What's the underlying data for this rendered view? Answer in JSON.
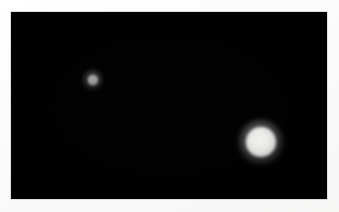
{
  "image": {
    "kind": "astronomical-photograph",
    "width": 339,
    "height": 212,
    "alt": "Dark astronomical field with two blurred glowing spherical objects",
    "background_color": "#000000",
    "mat_color": "#fdfdfd",
    "frame": {
      "left": 11,
      "top": 12,
      "width": 316,
      "height": 187
    }
  },
  "objects": [
    {
      "id": "body-small",
      "name": "small-dim-body",
      "center_x": 82,
      "center_y": 68,
      "disc_diameter": 11,
      "glow_diameter": 22,
      "core_color": "#a9a9a7",
      "edge_color": "#5a5a59",
      "relative_brightness": "dim"
    },
    {
      "id": "body-large",
      "name": "large-bright-body",
      "center_x": 250,
      "center_y": 130,
      "disc_diameter": 30,
      "glow_diameter": 46,
      "core_color": "#f2f2f0",
      "edge_color": "#b9b9b7",
      "relative_brightness": "bright"
    }
  ]
}
